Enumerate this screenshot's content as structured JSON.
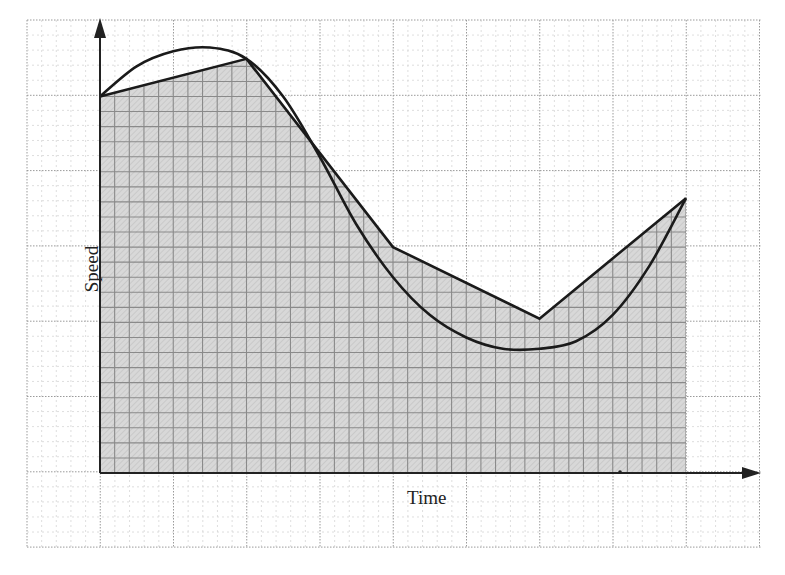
{
  "chart_data": {
    "type": "line",
    "title": "",
    "xlabel": "Time",
    "ylabel": "Speed",
    "grid": true,
    "legend": null,
    "units_note": "Axes unlabeled numerically; values in grid major-units from origin (1 major = 5 minor squares)",
    "xlim": [
      0,
      8
    ],
    "ylim": [
      0,
      6
    ],
    "series": [
      {
        "name": "speed-curve",
        "style": "smooth",
        "x": [
          0,
          0.5,
          1.0,
          1.5,
          2.0,
          2.5,
          3.0,
          3.5,
          4.0,
          4.5,
          5.0,
          5.5,
          6.0,
          6.5,
          7.0,
          7.5,
          8.0
        ],
        "y": [
          5.0,
          5.4,
          5.6,
          5.65,
          5.5,
          5.0,
          4.2,
          3.3,
          2.6,
          2.1,
          1.8,
          1.65,
          1.65,
          1.75,
          2.1,
          2.75,
          3.65
        ]
      },
      {
        "name": "polygonal-approximation",
        "style": "straight",
        "x": [
          0,
          2,
          4,
          6,
          8
        ],
        "y": [
          5.0,
          5.5,
          3.0,
          2.05,
          3.65
        ]
      }
    ],
    "shaded_region": "area under polygonal approximation from x=0 to x=8",
    "grid_info": {
      "major_x": 10,
      "major_y": 7,
      "minor_per_major": 5
    }
  },
  "labels": {
    "x_axis": "Time",
    "y_axis": "Speed"
  }
}
